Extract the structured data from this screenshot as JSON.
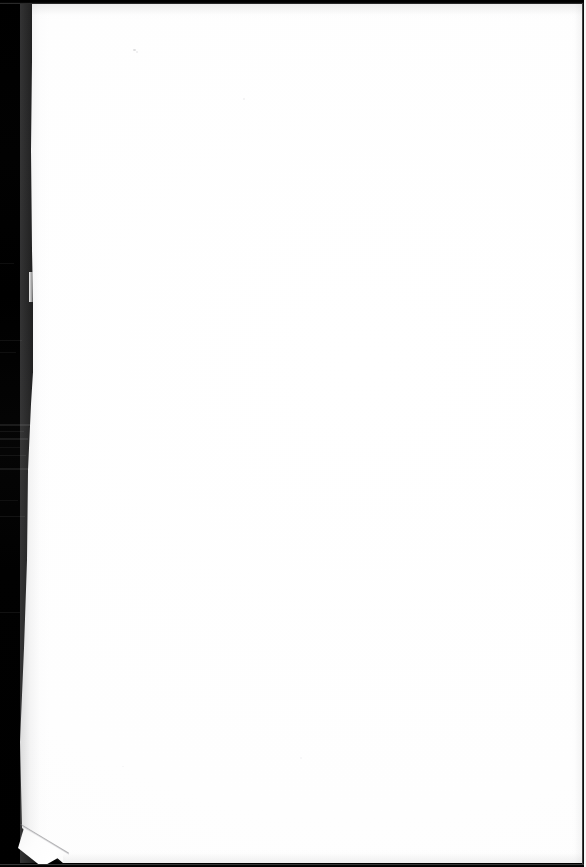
{
  "document": {
    "kind": "scanned-page",
    "page_state": "blank",
    "caption": "Blank scanned page with dog-eared bottom-left corner",
    "surface_color": "#fefefe",
    "background_color": "#000000",
    "dimensions": {
      "width": 586,
      "height": 867,
      "unit": "px"
    }
  },
  "page": {
    "content_text": "",
    "paper_color": "#fefefe",
    "edge_shadow_color": "#96969a"
  },
  "scanner": {
    "void_color": "#000000",
    "gutter_label": "scanner background",
    "streak_color": "#171717",
    "top_strip_color": "#000000",
    "bottom_strip_color": "#000000",
    "right_edge_color": "#1b1b1b"
  },
  "artifacts": {
    "folded_corner": {
      "name": "dog-eared corner",
      "position": "bottom-left",
      "crease_color": "#808084",
      "flap_color": "#f7f7f7"
    },
    "edge_nick": {
      "name": "edge nick",
      "position": "left-middle"
    },
    "specks": [
      {
        "label": "scan speck",
        "x": 133,
        "y": 49
      },
      {
        "label": "scan speck",
        "x": 243,
        "y": 98
      }
    ]
  }
}
